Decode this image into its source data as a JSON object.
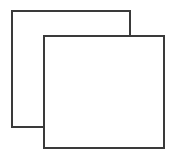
{
  "canvas": {
    "width": 178,
    "height": 156,
    "background_color": "#ffffff",
    "description": "Two overlapping outlined squares on a plain white background"
  },
  "figure": {
    "name": "overlapping-squares-diagram",
    "stroke_color": "#3a3a3a",
    "fill_color": "#ffffff",
    "stroke_width": 1.6,
    "shape_count": 2,
    "shapes": [
      {
        "id": "back-square",
        "label": "back-square",
        "type": "rectangle",
        "x": 12,
        "y": 11,
        "width": 118,
        "height": 116,
        "z_order": 1,
        "occluded": true,
        "fill": "#ffffff",
        "stroke": "#3a3a3a"
      },
      {
        "id": "front-square",
        "label": "front-square",
        "type": "rectangle",
        "x": 44,
        "y": 36,
        "width": 120,
        "height": 112,
        "z_order": 2,
        "occluded": false,
        "fill": "#ffffff",
        "stroke": "#3a3a3a"
      }
    ],
    "overlap_region": {
      "x": 44,
      "y": 36,
      "width": 86,
      "height": 91
    }
  }
}
